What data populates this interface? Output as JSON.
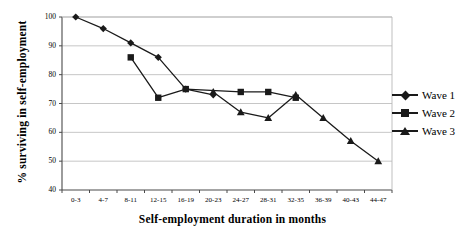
{
  "chart_data": {
    "type": "line",
    "title": "",
    "xlabel": "Self-employment duration in months",
    "ylabel": "% surviving in self-employment",
    "categories": [
      "0-3",
      "4-7",
      "8-11",
      "12-15",
      "16-19",
      "20-23",
      "24-27",
      "28-31",
      "32-35",
      "36-39",
      "40-43",
      "44-47"
    ],
    "ylim": [
      40,
      100
    ],
    "yticks": [
      100,
      90,
      80,
      70,
      60,
      50,
      40
    ],
    "grid": true,
    "legend_position": "right",
    "series": [
      {
        "name": "Wave 1",
        "marker": "diamond",
        "values": [
          100,
          96,
          91,
          86,
          75,
          73,
          null,
          null,
          null,
          null,
          null,
          null
        ]
      },
      {
        "name": "Wave 2",
        "marker": "square",
        "values": [
          null,
          null,
          86,
          72,
          75,
          null,
          74,
          74,
          72,
          null,
          null,
          null
        ]
      },
      {
        "name": "Wave 3",
        "marker": "triangle",
        "values": [
          null,
          null,
          null,
          null,
          null,
          74,
          67,
          65,
          73,
          65,
          57,
          50
        ]
      }
    ]
  },
  "legend": {
    "items": [
      {
        "label": "Wave 1",
        "marker": "diamond"
      },
      {
        "label": "Wave 2",
        "marker": "square"
      },
      {
        "label": "Wave 3",
        "marker": "triangle"
      }
    ]
  },
  "axes": {
    "y_title": "% surviving in self-employment",
    "x_title": "Self-employment duration in months"
  },
  "colors": {
    "series": "#1a1a1a",
    "grid": "#b8b8b8",
    "axis": "#4a4a4a",
    "background": "#ffffff"
  }
}
